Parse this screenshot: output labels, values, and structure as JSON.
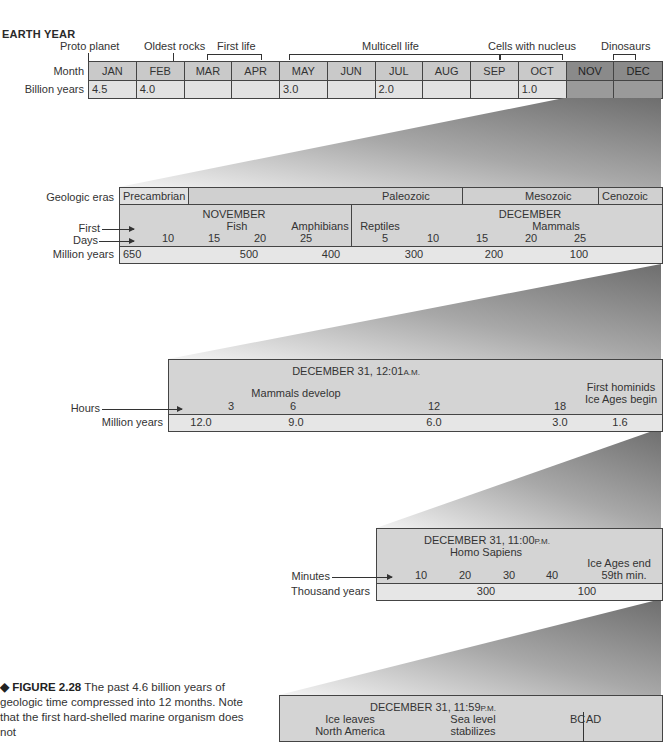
{
  "figure": {
    "title": "EARTH YEAR",
    "caption_label": "◆ FIGURE 2.28",
    "caption_text": "The past 4.6 billion years of geologic time compressed into 12 months. Note that the first hard-shelled marine organism does not"
  },
  "earth_year": {
    "row_labels": {
      "month": "Month",
      "billion_years": "Billion years"
    },
    "events": [
      {
        "label": "Proto planet"
      },
      {
        "label": "Oldest rocks"
      },
      {
        "label": "First life"
      },
      {
        "label": "Multicell life"
      },
      {
        "label": "Cells with nucleus"
      },
      {
        "label": "Dinosaurs"
      }
    ],
    "months": [
      {
        "name": "JAN",
        "value": "4.5"
      },
      {
        "name": "FEB",
        "value": "4.0"
      },
      {
        "name": "MAR",
        "value": ""
      },
      {
        "name": "APR",
        "value": ""
      },
      {
        "name": "MAY",
        "value": "3.0"
      },
      {
        "name": "JUN",
        "value": ""
      },
      {
        "name": "JUL",
        "value": "2.0"
      },
      {
        "name": "AUG",
        "value": ""
      },
      {
        "name": "SEP",
        "value": ""
      },
      {
        "name": "OCT",
        "value": "1.0"
      },
      {
        "name": "NOV",
        "value": ""
      },
      {
        "name": "DEC",
        "value": ""
      }
    ]
  },
  "nov_dec": {
    "row_labels": {
      "eras": "Geologic eras",
      "first": "First",
      "days": "Days",
      "million_years": "Million years"
    },
    "eras": [
      "Precambrian",
      "Paleozoic",
      "Mesozoic",
      "Cenozoic"
    ],
    "november_label": "NOVEMBER",
    "december_label": "DECEMBER",
    "events": [
      "Fish",
      "Amphibians",
      "Reptiles",
      "Mammals"
    ],
    "nov_days": [
      "10",
      "15",
      "20",
      "25"
    ],
    "dec_days": [
      "5",
      "10",
      "15",
      "20",
      "25"
    ],
    "million_years": [
      "650",
      "500",
      "400",
      "300",
      "200",
      "100"
    ]
  },
  "dec31_midnight": {
    "title": "DECEMBER 31, 12:01",
    "title_suffix": "A.M.",
    "row_labels": {
      "hours": "Hours",
      "million_years": "Million years"
    },
    "events": [
      "Mammals develop",
      "First hominids",
      "Ice Ages begin"
    ],
    "hours": [
      "3",
      "6",
      "12",
      "18"
    ],
    "million_years": [
      "12.0",
      "9.0",
      "6.0",
      "3.0",
      "1.6"
    ]
  },
  "dec31_11pm": {
    "title": "DECEMBER 31, 11:00",
    "title_suffix": "P.M.",
    "row_labels": {
      "minutes": "Minutes",
      "thousand_years": "Thousand years"
    },
    "events": [
      "Homo Sapiens",
      "Ice Ages end",
      "59th min."
    ],
    "minutes": [
      "10",
      "20",
      "30",
      "40"
    ],
    "thousand_years": [
      "300",
      "100"
    ]
  },
  "dec31_1159pm": {
    "title": "DECEMBER 31, 11:59",
    "title_suffix": "P.M.",
    "events": [
      "Ice leaves",
      "North America",
      "Sea level",
      "stabilizes"
    ],
    "bc": "BC",
    "ad": "AD"
  }
}
